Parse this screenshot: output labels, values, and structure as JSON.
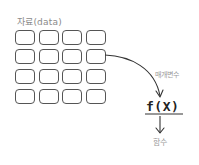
{
  "diagram": {
    "data_label": "자료(data)",
    "grid": {
      "rows": 4,
      "cols": 4,
      "cells": [
        [
          {
            "r": 0,
            "c": 0
          },
          {
            "r": 0,
            "c": 1
          },
          {
            "r": 0,
            "c": 2
          },
          {
            "r": 0,
            "c": 3
          }
        ],
        [
          {
            "r": 1,
            "c": 0
          },
          {
            "r": 1,
            "c": 1
          },
          {
            "r": 1,
            "c": 2
          },
          {
            "r": 1,
            "c": 3
          }
        ],
        [
          {
            "r": 2,
            "c": 0
          },
          {
            "r": 2,
            "c": 1
          },
          {
            "r": 2,
            "c": 2
          },
          {
            "r": 2,
            "c": 3
          }
        ],
        [
          {
            "r": 3,
            "c": 0
          },
          {
            "r": 3,
            "c": 1
          },
          {
            "r": 3,
            "c": 2
          },
          {
            "r": 3,
            "c": 3
          }
        ]
      ]
    },
    "arrow_source": {
      "row": 1,
      "col": 3
    },
    "parameter_label": "매개변수",
    "function_expression": "f(X)",
    "function_label": "함수",
    "colors": {
      "box_stroke": "#555555",
      "arrow": "#333333",
      "label_gray": "#8a8a8a",
      "expression": "#222222"
    }
  }
}
